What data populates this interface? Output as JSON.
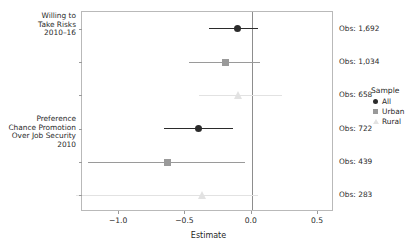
{
  "chart_data": {
    "type": "scatter",
    "title": "",
    "subtitle": "",
    "xlabel": "Estimate",
    "ylabel": "",
    "xlim": [
      -1.28,
      0.62
    ],
    "xticks": [
      -1.0,
      -0.5,
      0.0,
      0.5
    ],
    "xticklabels": [
      "−1.0",
      "−0.5",
      "0.0",
      "0.5"
    ],
    "grid": false,
    "zero_reference_line": 0.0,
    "legend": {
      "position": "right",
      "title": "Sample",
      "entries": [
        {
          "label": "All",
          "marker": "circle",
          "color": "#2b2b2b"
        },
        {
          "label": "Urban",
          "marker": "square",
          "color": "#9a9a9a"
        },
        {
          "label": "Rural",
          "marker": "triangle",
          "color": "#e2e2e2"
        }
      ]
    },
    "group_labels": [
      {
        "id": "willing-to-take-risks",
        "text": "Willing to\nTake Risks\n2010–16"
      },
      {
        "id": "preference-chance-promotion",
        "text": "Preference\nChance Promotion\nOver Job Security\n2010"
      }
    ],
    "points": [
      {
        "group": "Willing to Take Risks 2010–16",
        "sample": "All",
        "estimate": -0.105,
        "ci_low": -0.325,
        "ci_high": 0.045,
        "obs_label": "Obs: 1,692",
        "obs": 1692,
        "marker": "circle",
        "color": "#2b2b2b"
      },
      {
        "group": "Willing to Take Risks 2010–16",
        "sample": "Urban",
        "estimate": -0.196,
        "ci_low": -0.47,
        "ci_high": 0.065,
        "obs_label": "Obs: 1,034",
        "obs": 1034,
        "marker": "square",
        "color": "#9a9a9a"
      },
      {
        "group": "Willing to Take Risks 2010–16",
        "sample": "Rural",
        "estimate": -0.102,
        "ci_low": -0.395,
        "ci_high": 0.23,
        "obs_label": "Obs: 658",
        "obs": 658,
        "marker": "triangle",
        "color": "#e2e2e2"
      },
      {
        "group": "Preference Chance Promotion Over Job Security 2010",
        "sample": "All",
        "estimate": -0.402,
        "ci_low": -0.665,
        "ci_high": -0.138,
        "obs_label": "Obs: 722",
        "obs": 722,
        "marker": "circle",
        "color": "#2b2b2b"
      },
      {
        "group": "Preference Chance Promotion Over Job Security 2010",
        "sample": "Urban",
        "estimate": -0.635,
        "ci_low": -1.235,
        "ci_high": -0.048,
        "obs_label": "Obs: 439",
        "obs": 439,
        "marker": "square",
        "color": "#9a9a9a"
      },
      {
        "group": "Preference Chance Promotion Over Job Security 2010",
        "sample": "Rural",
        "estimate": -0.372,
        "ci_low": -1.325,
        "ci_high": 0.045,
        "obs_label": "Obs: 283",
        "obs": 283,
        "marker": "triangle",
        "color": "#e2e2e2"
      }
    ]
  }
}
